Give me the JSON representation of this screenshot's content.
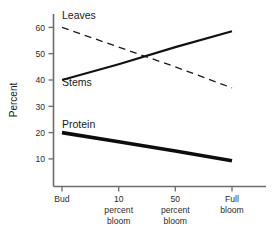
{
  "chart_data": {
    "type": "line",
    "title": "",
    "xlabel": "",
    "ylabel": "Percent",
    "categories": [
      "Bud",
      "10 percent bloom",
      "50 percent bloom",
      "Full bloom"
    ],
    "category_lines": [
      [
        "Bud"
      ],
      [
        "10",
        "percent",
        "bloom"
      ],
      [
        "50",
        "percent",
        "bloom"
      ],
      [
        "Full",
        "bloom"
      ]
    ],
    "ylim": [
      0,
      65
    ],
    "yticks": [
      10,
      20,
      30,
      40,
      50,
      60
    ],
    "ytick_labels": [
      "10",
      "20",
      "30",
      "40",
      "50",
      "60"
    ],
    "grid": false,
    "legend_position": "inline-annotations",
    "series": [
      {
        "name": "Leaves",
        "style": "dashed",
        "values": [
          60,
          52.5,
          45,
          37
        ]
      },
      {
        "name": "Stems",
        "style": "solid-thin",
        "values": [
          40,
          46,
          52.5,
          58.5
        ]
      },
      {
        "name": "Protein",
        "style": "solid-thick",
        "values": [
          20,
          16.5,
          13,
          9.3
        ]
      }
    ],
    "annotations": [
      {
        "text": "Leaves",
        "x_px": 62,
        "y_px": 19
      },
      {
        "text": "Stems",
        "x_px": 62,
        "y_px": 86
      },
      {
        "text": "Protein",
        "x_px": 62,
        "y_px": 128
      }
    ],
    "colors": {
      "axis": "#6b6b6b",
      "text": "#1a1a1a",
      "leaves": "#1a1a1a",
      "stems": "#111111",
      "protein": "#0d0d0d",
      "background": "#ffffff"
    }
  }
}
